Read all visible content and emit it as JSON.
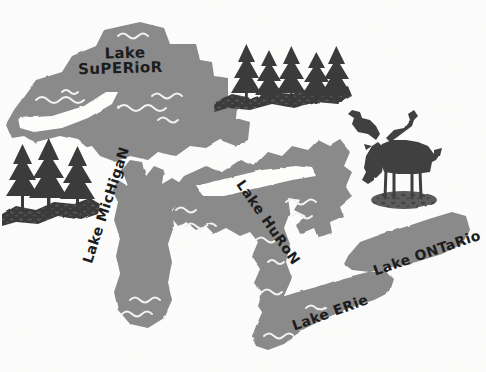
{
  "illustration": {
    "title": "Great Lakes Illustrated Map",
    "background_color": "#fdfdfc",
    "water_color": "#8a8a8a",
    "wave_color": "#f2f2f0",
    "forest_color": "#3a3a3a",
    "ground_color": "#4a4a4a",
    "moose_color": "#3f3f3f",
    "text_color": "#1c1c1c"
  },
  "lakes": [
    {
      "id": "superior",
      "name": "Lake Superior",
      "label_line_1": "Lake",
      "label_line_2": "SuPERioR",
      "wave_count": 5
    },
    {
      "id": "michigan",
      "name": "Lake Michigan",
      "label": "Lake MicHigaN",
      "wave_count": 3
    },
    {
      "id": "huron",
      "name": "Lake Huron",
      "label": "Lake HuRoN",
      "wave_count": 6
    },
    {
      "id": "erie",
      "name": "Lake Erie",
      "label": "Lake ERie",
      "wave_count": 2
    },
    {
      "id": "ontario",
      "name": "Lake Ontario",
      "label": "Lake ONTaRio",
      "wave_count": 0
    }
  ],
  "scenery": [
    {
      "id": "forest-left",
      "type": "pine-forest",
      "tree_count": 3,
      "description": "Pine trees on ground mound at left edge"
    },
    {
      "id": "forest-top",
      "type": "pine-forest",
      "tree_count": 5,
      "description": "Pine trees on ground ridge above Lake Huron"
    },
    {
      "id": "moose",
      "type": "moose",
      "description": "Moose silhouette with palmate antlers standing on a mound"
    }
  ]
}
